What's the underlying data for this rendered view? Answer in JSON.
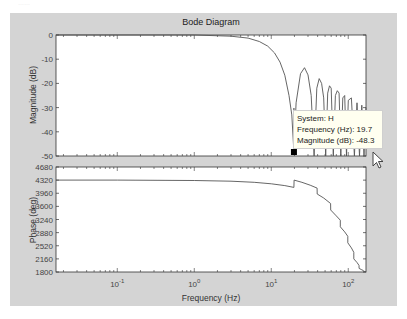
{
  "figure": {
    "title": "Bode Diagram",
    "corner_text": "……"
  },
  "magnitude_axis": {
    "ylabel": "Magnitude (dB)",
    "ticks": [
      "0",
      "-10",
      "-20",
      "-30",
      "-40",
      "-50"
    ]
  },
  "phase_axis": {
    "ylabel": "Phase (deg)",
    "ticks": [
      "4680",
      "4320",
      "3960",
      "3600",
      "3240",
      "2880",
      "2520",
      "2160",
      "1800"
    ]
  },
  "x_axis": {
    "xlabel": "Frequency  (Hz)",
    "ticks": [
      "10",
      "10",
      "10",
      "10"
    ],
    "exponents": [
      "-1",
      "0",
      "1",
      "2"
    ]
  },
  "datatip": {
    "system": "System: H",
    "frequency": "Frequency (Hz): 19.7",
    "magnitude": "Magnitude (dB): -48.3",
    "marker_color": "#000000"
  },
  "colors": {
    "curve": "#555555",
    "panel": "#d4d4d4",
    "axes_bg": "#ffffff"
  },
  "chart_data": [
    {
      "type": "line",
      "title": "Bode Diagram",
      "subplot": "magnitude",
      "xlabel": "Frequency  (Hz)",
      "ylabel": "Magnitude (dB)",
      "xscale": "log",
      "xlim": [
        0.016,
        170
      ],
      "ylim": [
        -50,
        0
      ],
      "yticks": [
        0,
        -10,
        -20,
        -30,
        -40,
        -50
      ],
      "xticks": [
        0.1,
        1,
        10,
        100
      ],
      "x": [
        0.016,
        0.1,
        1,
        3,
        5,
        7,
        9,
        11,
        13,
        15,
        17,
        18.5,
        19.7,
        21,
        24,
        27,
        30,
        33,
        36,
        39,
        42,
        45,
        48,
        51,
        54,
        57,
        60,
        64,
        68,
        72,
        76,
        80,
        85,
        90,
        95,
        100,
        110,
        120,
        130,
        140,
        150,
        160,
        170
      ],
      "y": [
        0,
        0,
        0,
        -0.5,
        -1.3,
        -2.7,
        -4.6,
        -7.4,
        -11.2,
        -16.6,
        -25,
        -33,
        -48.3,
        -28,
        -16,
        -13.5,
        -16.5,
        -25,
        -50,
        -22,
        -18,
        -20,
        -26,
        -50,
        -24,
        -21,
        -22,
        -50,
        -25,
        -23,
        -24,
        -50,
        -26,
        -25,
        -50,
        -27,
        -26,
        -50,
        -28,
        -50,
        -29,
        -50,
        -30
      ],
      "annotation": {
        "text": "System: H / Frequency (Hz): 19.7 / Magnitude (dB): -48.3",
        "x": 19.7,
        "y": -48.3
      }
    },
    {
      "type": "line",
      "subplot": "phase",
      "xlabel": "Frequency  (Hz)",
      "ylabel": "Phase (deg)",
      "xscale": "log",
      "xlim": [
        0.016,
        170
      ],
      "ylim": [
        1800,
        4680
      ],
      "yticks": [
        4680,
        4320,
        3960,
        3600,
        3240,
        2880,
        2520,
        2160,
        1800
      ],
      "xticks": [
        0.1,
        1,
        10,
        100
      ],
      "x": [
        0.016,
        0.1,
        1,
        3,
        6,
        10,
        15,
        19.7,
        19.8,
        25,
        32,
        39.4,
        39.5,
        48,
        59,
        59.1,
        70,
        78.8,
        78.9,
        90,
        98.5,
        98.6,
        110,
        118,
        118.1,
        130,
        138,
        138.1,
        150,
        157,
        157.1,
        170
      ],
      "y": [
        4320,
        4320,
        4310,
        4290,
        4260,
        4220,
        4170,
        4120,
        4320,
        4260,
        4180,
        4100,
        3940,
        3830,
        3680,
        3500,
        3340,
        3220,
        3040,
        2900,
        2780,
        2600,
        2460,
        2340,
        2160,
        2060,
        1980,
        1900,
        1860,
        1840,
        1820,
        1810
      ]
    }
  ]
}
